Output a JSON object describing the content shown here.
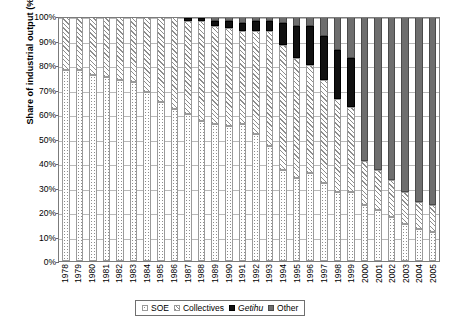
{
  "chart_data": {
    "type": "bar",
    "stacked": true,
    "title": "",
    "xlabel": "",
    "ylabel": "Share of industrial output (%)",
    "ylim": [
      0,
      100
    ],
    "ytick_labels": [
      "0%",
      "10%",
      "20%",
      "30%",
      "40%",
      "50%",
      "60%",
      "70%",
      "80%",
      "90%",
      "100%"
    ],
    "ytick_values": [
      0,
      10,
      20,
      30,
      40,
      50,
      60,
      70,
      80,
      90,
      100
    ],
    "grid": true,
    "legend_position": "bottom",
    "categories": [
      "1978",
      "1979",
      "1980",
      "1981",
      "1982",
      "1983",
      "1984",
      "1985",
      "1986",
      "1987",
      "1988",
      "1989",
      "1990",
      "1991",
      "1992",
      "1993",
      "1994",
      "1995",
      "1996",
      "1997",
      "1998",
      "1999",
      "2000",
      "2001",
      "2002",
      "2003",
      "2004",
      "2005"
    ],
    "series": [
      {
        "name": "SOE",
        "pattern": "dotted",
        "values": [
          78,
          78,
          76,
          75,
          74,
          73,
          69,
          65,
          62,
          60,
          57,
          56,
          55,
          56,
          52,
          47,
          37,
          34,
          36,
          32,
          28,
          28,
          23,
          21,
          18,
          15,
          13,
          12
        ]
      },
      {
        "name": "Collectives",
        "pattern": "diagonal-hatch",
        "values": [
          22,
          22,
          24,
          25,
          26,
          27,
          31,
          35,
          38,
          38,
          41,
          40,
          40,
          38,
          42,
          47,
          51,
          49,
          44,
          42,
          38,
          35,
          18,
          16,
          15,
          13,
          11,
          11
        ]
      },
      {
        "name": "Getihu",
        "pattern": "solid-black",
        "values": [
          0,
          0,
          0,
          0,
          0,
          0,
          0,
          0,
          0,
          1,
          1,
          2,
          3,
          3,
          4,
          4,
          9,
          13,
          16,
          18,
          20,
          20,
          0,
          0,
          0,
          0,
          0,
          0
        ]
      },
      {
        "name": "Other",
        "pattern": "solid-gray",
        "values": [
          0,
          0,
          0,
          0,
          0,
          0,
          0,
          0,
          0,
          1,
          1,
          2,
          2,
          3,
          2,
          2,
          3,
          4,
          4,
          8,
          14,
          17,
          59,
          63,
          67,
          72,
          76,
          77
        ]
      }
    ]
  },
  "legend": {
    "items": [
      {
        "label": "SOE",
        "key": "soe",
        "italic": false
      },
      {
        "label": "Collectives",
        "key": "col",
        "italic": false
      },
      {
        "label": "Getihu",
        "key": "get",
        "italic": true
      },
      {
        "label": "Other",
        "key": "oth",
        "italic": false
      }
    ]
  }
}
